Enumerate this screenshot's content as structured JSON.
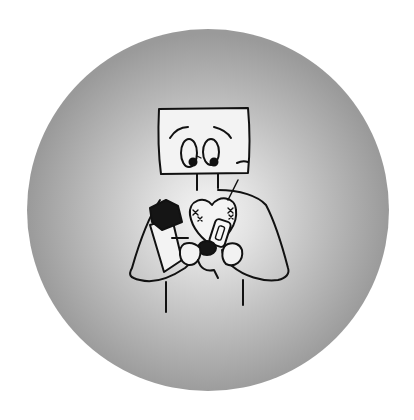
{
  "illustration": {
    "subject": "cartoon character with a monitor-shaped head hugging an armful of items",
    "background": {
      "shape": "circle",
      "center_x": 208,
      "center_y": 210,
      "radius": 181,
      "gradient_inner": "#f4f4f4",
      "gradient_mid": "#cfcfcf",
      "gradient_outer": "#9c9c9c",
      "page_color": "#ffffff"
    },
    "line_color": "#111111",
    "fill_light": "#f2f2f2",
    "fill_dark": "#151515"
  }
}
